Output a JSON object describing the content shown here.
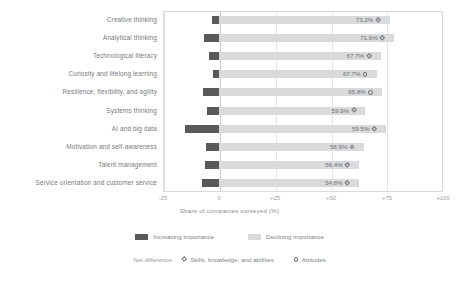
{
  "chart_data": {
    "type": "bar",
    "title": "",
    "subtitle": "",
    "xlabel": "Share of companies surveyed (%)",
    "ylabel": "",
    "xlim": [
      -25,
      100
    ],
    "xticks": [
      "-25",
      "0",
      "+25",
      "+50",
      "+75",
      "+100"
    ],
    "xtick_values": [
      -25,
      0,
      25,
      50,
      75,
      100
    ],
    "grid": true,
    "orientation": "horizontal",
    "legend_position": "bottom",
    "categories": [
      "Creative thinking",
      "Analytical thinking",
      "Technological literacy",
      "Curiosity and lifelong learning",
      "Resilience, flexibility, and agility",
      "Systems thinking",
      "AI and big data",
      "Motivation and self-awareness",
      "Talent management",
      "Service orientation and customer service"
    ],
    "series": [
      {
        "name": "Increasing importance",
        "color": "#d9dadb",
        "values": [
          76.2,
          78.2,
          72.1,
          70.5,
          72.9,
          65.4,
          74.5,
          64.7,
          62.6,
          62.5
        ]
      },
      {
        "name": "Declining importance",
        "color": "#58595b",
        "values": [
          -3.0,
          -6.6,
          -4.4,
          -2.8,
          -7.1,
          -5.5,
          -15.0,
          -5.8,
          -6.2,
          -7.7
        ]
      }
    ],
    "net_difference": {
      "label": "Net difference:",
      "marker_types": [
        "Skills, knowledge, and abilities",
        "Attitudes"
      ],
      "points": [
        {
          "category": "Creative thinking",
          "value": "73.2%",
          "marker": "diamond"
        },
        {
          "category": "Analytical thinking",
          "value": "71.6%",
          "marker": "diamond"
        },
        {
          "category": "Technological literacy",
          "value": "67.7%",
          "marker": "diamond"
        },
        {
          "category": "Curiosity and lifelong learning",
          "value": "67.7%",
          "marker": "circle"
        },
        {
          "category": "Resilience, flexibility, and agility",
          "value": "65.8%",
          "marker": "circle"
        },
        {
          "category": "Systems thinking",
          "value": "59.9%",
          "marker": "diamond"
        },
        {
          "category": "AI and big data",
          "value": "59.5%",
          "marker": "diamond"
        },
        {
          "category": "Motivation and self-awareness",
          "value": "58.9%",
          "marker": "circle"
        },
        {
          "category": "Talent management",
          "value": "56.4%",
          "marker": "diamond"
        },
        {
          "category": "Service orientation and customer service",
          "value": "54.8%",
          "marker": "diamond"
        }
      ]
    }
  },
  "legend": {
    "increasing_label": "Increasing importance",
    "declining_label": "Declining importance",
    "net_label": "Net difference:",
    "net_skills_label": "Skills, knowledge, and abilities",
    "net_attitudes_label": "Attitudes"
  },
  "axis": {
    "x_title": "Share of companies surveyed (%)"
  },
  "colors": {
    "increasing": "#58595b",
    "declining": "#d9dadb",
    "text": "#6f7276",
    "grid": "#e3e5e8"
  }
}
